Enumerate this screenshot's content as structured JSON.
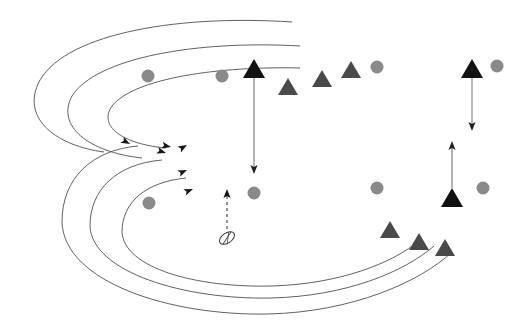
{
  "canvas": {
    "width": 527,
    "height": 324,
    "background": "#ffffff",
    "title": "nested-trajectory-diagram"
  },
  "palette": {
    "curve_stroke": "#4f4f4f",
    "arrow_black": "#151515",
    "arrow_gray": "#8c8c8c",
    "triangle_gray": "#4a4a4a",
    "triangle_black": "#121212",
    "circle_gray": "#8a8a8a",
    "ellipse_stroke": "#3a3a3a",
    "dashed_stroke": "#3a3a3a"
  },
  "geometry": {
    "curve_stroke_width": 0.9,
    "arrow_stroke_width": 1.2,
    "gray_arrow_stroke_width": 1.3,
    "dashed_dasharray": "3 3",
    "triangle_gray_half_width": 10,
    "triangle_gray_height": 17,
    "triangle_black_half_width": 11,
    "triangle_black_height": 19,
    "circle_radius": 6.5
  },
  "upper_curve_group": {
    "name": "upper-nested-curves",
    "count": 3,
    "paths": [
      "M 292 22 C 170 14 60 36 38 84 C 22 120 58 146 104 152",
      "M 300 46 C 196 40 96 58 72 96 C 56 126 88 152 142 158",
      "M 300 68 C 220 66 134 78 112 106 C 98 126 122 144 166 148"
    ],
    "arrow_tips": [
      {
        "x": 130,
        "y": 144,
        "angle": 28
      },
      {
        "x": 166,
        "y": 153,
        "angle": 18
      },
      {
        "x": 171,
        "y": 147,
        "angle": 12
      }
    ]
  },
  "lower_curve_group": {
    "name": "lower-nested-curves",
    "count": 3,
    "paths": [
      "M 138 146 C 92 150 62 178 62 222 C 64 282 170 316 268 314 C 352 312 420 282 452 252",
      "M 162 160 C 116 164 90 190 90 226 C 92 272 184 300 272 298 C 346 296 404 272 434 246",
      "M 186 178 C 146 182 122 202 122 232 C 124 268 196 288 272 286 C 338 284 392 264 420 240"
    ],
    "arrow_tips": [
      {
        "x": 187,
        "y": 145,
        "angle": -30
      },
      {
        "x": 187,
        "y": 170,
        "angle": -24
      },
      {
        "x": 193,
        "y": 189,
        "angle": -22
      }
    ]
  },
  "vertical_arrows": [
    {
      "name": "center-down-arrow",
      "from": {
        "x": 254,
        "y": 78
      },
      "to": {
        "x": 254,
        "y": 174
      },
      "color": "gray",
      "style": "solid",
      "head": "down"
    },
    {
      "name": "right-upper-down-arrow",
      "from": {
        "x": 472,
        "y": 78
      },
      "to": {
        "x": 472,
        "y": 131
      },
      "color": "gray",
      "style": "solid",
      "head": "down"
    },
    {
      "name": "right-lower-up-arrow",
      "from": {
        "x": 452,
        "y": 188
      },
      "to": {
        "x": 452,
        "y": 141
      },
      "color": "gray",
      "style": "solid",
      "head": "up"
    },
    {
      "name": "center-dashed-up-arrow",
      "from": {
        "x": 227,
        "y": 229
      },
      "to": {
        "x": 227,
        "y": 189
      },
      "color": "black",
      "style": "dashed",
      "head": "up"
    }
  ],
  "triangles_gray": [
    {
      "name": "triangle-gray-top-1",
      "x": 288,
      "y": 95
    },
    {
      "name": "triangle-gray-top-2",
      "x": 322,
      "y": 87
    },
    {
      "name": "triangle-gray-top-3",
      "x": 351,
      "y": 78
    },
    {
      "name": "triangle-gray-bottom-1",
      "x": 390,
      "y": 238
    },
    {
      "name": "triangle-gray-bottom-2",
      "x": 419,
      "y": 250
    },
    {
      "name": "triangle-gray-bottom-3",
      "x": 445,
      "y": 256
    }
  ],
  "triangles_black": [
    {
      "name": "triangle-black-center-top",
      "x": 254,
      "y": 78
    },
    {
      "name": "triangle-black-right-top",
      "x": 472,
      "y": 78
    },
    {
      "name": "triangle-black-right-bottom",
      "x": 452,
      "y": 207
    }
  ],
  "circles": [
    {
      "name": "circle-top-left",
      "x": 148,
      "y": 76
    },
    {
      "name": "circle-top-mid",
      "x": 222,
      "y": 76
    },
    {
      "name": "circle-top-right",
      "x": 377,
      "y": 67
    },
    {
      "name": "circle-far-right-top",
      "x": 497,
      "y": 66
    },
    {
      "name": "circle-mid-left",
      "x": 149,
      "y": 203
    },
    {
      "name": "circle-mid-center",
      "x": 254,
      "y": 193
    },
    {
      "name": "circle-mid-right",
      "x": 377,
      "y": 188
    },
    {
      "name": "circle-far-right-mid",
      "x": 483,
      "y": 188
    }
  ],
  "ellipse_marker": {
    "name": "hatched-ellipse-marker",
    "cx": 227,
    "cy": 238,
    "rx": 8.5,
    "ry": 5,
    "rotation": -35,
    "inner_tick_count": 2
  }
}
